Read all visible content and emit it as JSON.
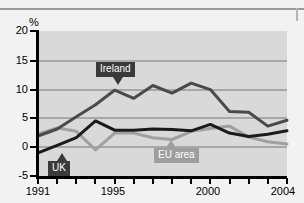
{
  "chart_data": {
    "type": "line",
    "title": "",
    "xlabel": "",
    "ylabel": "%",
    "unit_label": "%",
    "ylim": [
      -5,
      20
    ],
    "xlim": [
      1991,
      2004
    ],
    "grid": true,
    "legend_position": "inline-callouts",
    "y_ticks": [
      "20",
      "15",
      "10",
      "5",
      "0",
      "-5"
    ],
    "x_ticks_labeled": [
      "1991",
      "1995",
      "2000",
      "2004"
    ],
    "x": [
      1991,
      1992,
      1993,
      1994,
      1995,
      1996,
      1997,
      1998,
      1999,
      2000,
      2001,
      2002,
      2003,
      2004
    ],
    "series": [
      {
        "name": "Ireland",
        "color": "#4a4a4a",
        "values": [
          1.9,
          3.1,
          5.2,
          7.3,
          9.8,
          8.4,
          10.6,
          9.3,
          11.0,
          9.9,
          6.1,
          6.0,
          3.6,
          4.6
        ]
      },
      {
        "name": "UK",
        "color": "#1a1a1a",
        "values": [
          -1.0,
          0.3,
          1.6,
          4.5,
          2.9,
          2.9,
          3.1,
          3.0,
          2.8,
          3.9,
          2.4,
          1.8,
          2.2,
          2.8
        ]
      },
      {
        "name": "EU area",
        "color": "#a0a0a0",
        "values": [
          2.2,
          3.3,
          2.7,
          -0.5,
          2.4,
          2.4,
          1.6,
          1.3,
          2.7,
          3.2,
          3.6,
          1.7,
          0.9,
          0.5
        ]
      }
    ],
    "callouts": [
      {
        "label": "Ireland",
        "style": "dark"
      },
      {
        "label": "UK",
        "style": "dark"
      },
      {
        "label": "EU area",
        "style": "grey"
      }
    ]
  }
}
